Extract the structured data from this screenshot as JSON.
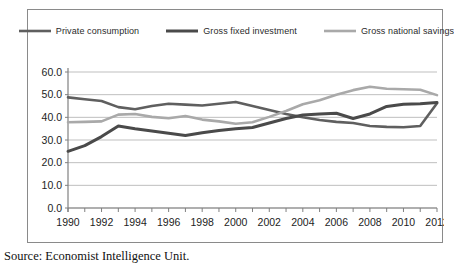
{
  "caption": {
    "source_text": "Source: Economist Intelligence Unit."
  },
  "legend": {
    "position": "top-center",
    "items": [
      {
        "label": "Private consumption",
        "color": "#5f5f5f",
        "width": 2.6
      },
      {
        "label": "Gross fixed investment",
        "color": "#4a4a4a",
        "width": 3.0
      },
      {
        "label": "Gross national savings",
        "color": "#a9a9a9",
        "width": 2.6
      }
    ]
  },
  "axes": {
    "y_ticks": [
      "0.0",
      "10.0",
      "20.0",
      "30.0",
      "40.0",
      "50.0",
      "60.0"
    ],
    "x_ticks": [
      "1990",
      "1992",
      "1994",
      "1996",
      "1998",
      "2000",
      "2002",
      "2004",
      "2006",
      "2008",
      "2010",
      "2012"
    ],
    "grid_color": "#bfbfbf",
    "axis_color": "#808080"
  },
  "chart_data": {
    "type": "line",
    "title": "",
    "xlabel": "",
    "ylabel": "",
    "ylim": [
      0,
      60
    ],
    "xlim": [
      1990,
      2012
    ],
    "ytick_step": 10,
    "grid": true,
    "legend_position": "top-center",
    "x": [
      1990,
      1991,
      1992,
      1993,
      1994,
      1995,
      1996,
      1997,
      1998,
      1999,
      2000,
      2001,
      2002,
      2003,
      2004,
      2005,
      2006,
      2007,
      2008,
      2009,
      2010,
      2011,
      2012
    ],
    "series": [
      {
        "name": "Private consumption",
        "color": "#5f5f5f",
        "values": [
          48.8,
          48.0,
          47.2,
          44.5,
          43.6,
          45.0,
          46.0,
          45.6,
          45.2,
          46.0,
          46.8,
          45.0,
          43.2,
          41.5,
          40.0,
          38.8,
          38.0,
          37.5,
          36.2,
          35.8,
          35.6,
          36.2,
          46.2
        ]
      },
      {
        "name": "Gross fixed investment",
        "color": "#4a4a4a",
        "values": [
          25.0,
          27.5,
          31.5,
          36.2,
          35.0,
          34.0,
          33.0,
          32.0,
          33.2,
          34.2,
          35.0,
          35.5,
          37.5,
          39.5,
          41.0,
          41.5,
          41.8,
          39.5,
          41.5,
          44.8,
          45.8,
          46.0,
          46.5
        ]
      },
      {
        "name": "Gross national savings",
        "color": "#a9a9a9",
        "values": [
          37.8,
          38.0,
          38.2,
          41.2,
          41.5,
          40.2,
          39.6,
          40.6,
          39.0,
          38.2,
          37.2,
          37.8,
          40.2,
          42.8,
          45.8,
          47.5,
          50.0,
          52.0,
          53.5,
          52.6,
          52.4,
          52.2,
          49.8
        ]
      }
    ]
  }
}
